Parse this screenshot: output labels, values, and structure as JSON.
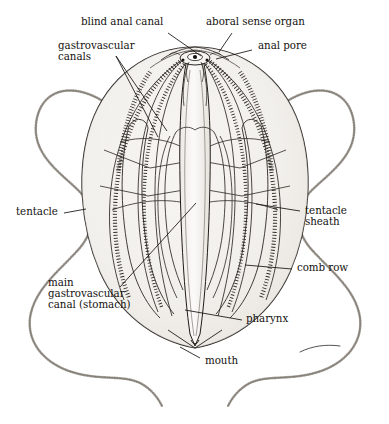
{
  "figure": {
    "view": "whole animal, cutaway lateral view",
    "background_color": "#ffffff",
    "ink_color": "#15120f",
    "body_fill_color": "#f0eeea",
    "body_shade_color": "#e2dfd9",
    "line_color": "#201c18"
  },
  "labels": {
    "blind_anal_canal": "blind anal canal",
    "aboral_sense_organ": "aboral sense organ",
    "anal_pore": "anal pore",
    "gastrovascular_canals_line1": "gastrovascular",
    "gastrovascular_canals_line2": "canals",
    "tentacle": "tentacle",
    "tentacle_sheath_line1": "tentacle",
    "tentacle_sheath_line2": "sheath",
    "comb_row": "comb row",
    "main_gastrovascular_line1": "main",
    "main_gastrovascular_line2": "gastrovascular",
    "main_gastrovascular_line3": "canal (stomach)",
    "pharynx": "pharynx",
    "mouth": "mouth"
  },
  "parts": [
    {
      "name": "blind anal canal",
      "label_x": 81,
      "label_y": 22,
      "leader": [
        [
          168,
          33
        ],
        [
          201,
          56
        ]
      ]
    },
    {
      "name": "aboral sense organ",
      "label_x": 206,
      "label_y": 22,
      "leader": [
        [
          232,
          33
        ],
        [
          219,
          52
        ]
      ]
    },
    {
      "name": "anal pore",
      "label_x": 255,
      "label_y": 46,
      "leader": [
        [
          252,
          50
        ],
        [
          216,
          59
        ]
      ]
    },
    {
      "name": "gastrovascular canals",
      "label_x": 58,
      "label_y": 44,
      "leader": [
        [
          116,
          56
        ],
        [
          167,
          131
        ]
      ]
    },
    {
      "name": "tentacle",
      "label_x": 18,
      "label_y": 208,
      "leader": [
        [
          64,
          213
        ],
        [
          83,
          210
        ]
      ]
    },
    {
      "name": "tentacle sheath",
      "label_x": 305,
      "label_y": 206,
      "leader": [
        [
          300,
          211
        ],
        [
          256,
          204
        ]
      ]
    },
    {
      "name": "comb row",
      "label_x": 297,
      "label_y": 265,
      "leader": [
        [
          292,
          269
        ],
        [
          245,
          265
        ]
      ]
    },
    {
      "name": "main gastrovascular canal (stomach)",
      "label_x": 48,
      "label_y": 282,
      "leader": [
        [
          120,
          287
        ],
        [
          196,
          203
        ]
      ]
    },
    {
      "name": "pharynx",
      "label_x": 246,
      "label_y": 316,
      "leader": [
        [
          242,
          320
        ],
        [
          185,
          310
        ]
      ]
    },
    {
      "name": "mouth",
      "label_x": 203,
      "label_y": 360,
      "leader": [
        [
          200,
          358
        ],
        [
          180,
          347
        ]
      ]
    }
  ]
}
